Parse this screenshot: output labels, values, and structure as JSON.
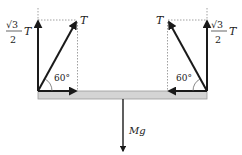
{
  "diagram": {
    "beam": {
      "fill": "#d4d4d4",
      "stroke": "#9a9a9a"
    },
    "left_support": {
      "tension_label": "T",
      "vertical_component_numerator": "√3",
      "vertical_component_denominator": "2",
      "vertical_component_symbol": "T",
      "angle_label": "60°"
    },
    "right_support": {
      "tension_label": "T",
      "vertical_component_numerator": "√3",
      "vertical_component_denominator": "2",
      "vertical_component_symbol": "T",
      "angle_label": "60°"
    },
    "weight": {
      "label": "Mg"
    },
    "colors": {
      "arrow": "#1a1a1a",
      "dotted": "#888888"
    }
  }
}
